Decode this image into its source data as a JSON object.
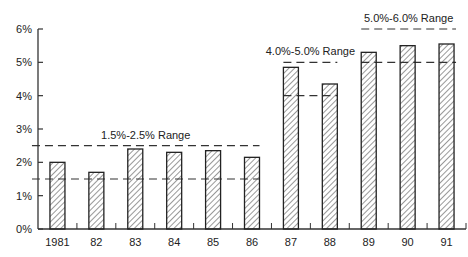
{
  "chart_data": {
    "type": "bar",
    "title": "",
    "xlabel": "",
    "ylabel": "",
    "ylim": [
      0,
      6
    ],
    "yticks": [
      "0%",
      "1%",
      "2%",
      "3%",
      "4%",
      "5%",
      "6%"
    ],
    "categories": [
      "1981",
      "82",
      "83",
      "84",
      "85",
      "86",
      "87",
      "88",
      "89",
      "90",
      "91"
    ],
    "values": [
      2.0,
      1.7,
      2.4,
      2.3,
      2.35,
      2.15,
      4.85,
      4.35,
      5.3,
      5.5,
      5.55
    ],
    "grid": false,
    "bar_fill": "diagonal-hatch",
    "annotations": [
      {
        "label": "1.5%-2.5% Range",
        "low": 1.5,
        "high": 2.5,
        "from": "1981",
        "to": "86"
      },
      {
        "label": "4.0%-5.0% Range",
        "low": 4.0,
        "high": 5.0,
        "from": "87",
        "to": "88"
      },
      {
        "label": "5.0%-6.0% Range",
        "low": 5.0,
        "high": 6.0,
        "from": "89",
        "to": "91"
      }
    ]
  }
}
